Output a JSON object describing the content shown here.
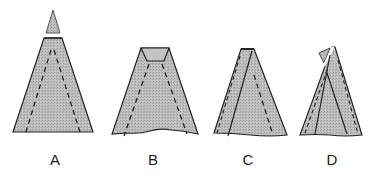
{
  "figure": {
    "colors": {
      "fill": "#b8b8b8",
      "stroke": "#222222",
      "background": "#ffffff"
    },
    "panels": [
      {
        "id": "A",
        "label": "A"
      },
      {
        "id": "B",
        "label": "B"
      },
      {
        "id": "C",
        "label": "C"
      },
      {
        "id": "D",
        "label": "D"
      }
    ]
  }
}
